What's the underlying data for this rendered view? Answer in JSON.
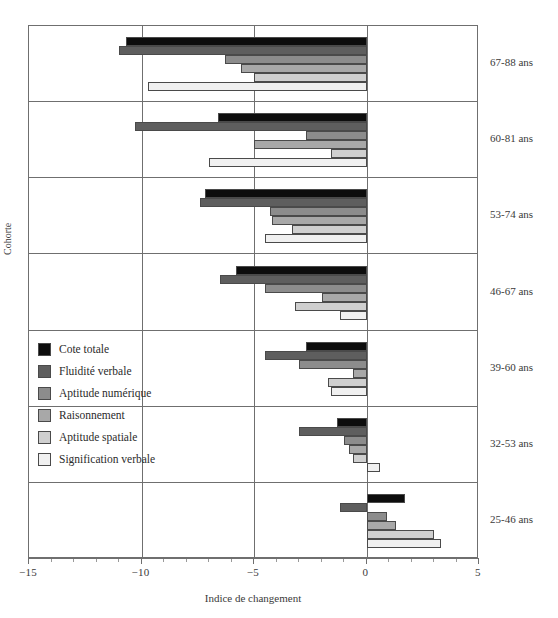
{
  "chart_data": {
    "type": "bar",
    "orientation": "horizontal",
    "title": "",
    "xlabel": "Indice de changement",
    "ylabel": "Cohorte",
    "xlim": [
      -15,
      5
    ],
    "xticks": [
      -15,
      -10,
      -5,
      0,
      5
    ],
    "xtick_labels": [
      "−15",
      "−10",
      "−5",
      "0",
      "5"
    ],
    "grid": "vertical gridlines at major x ticks; horizontal separators between cohort bands",
    "legend_position": "inside-left-middle",
    "categories": [
      "67-88 ans",
      "60-81 ans",
      "53-74 ans",
      "46-67 ans",
      "39-60 ans",
      "32-53 ans",
      "25-46 ans"
    ],
    "series": [
      {
        "name": "Cote totale",
        "color": "#0d0d0d",
        "values": [
          -10.7,
          -6.6,
          -7.2,
          -5.8,
          -2.7,
          -1.3,
          1.7
        ]
      },
      {
        "name": "Fluidité verbale",
        "color": "#5e5e5e",
        "values": [
          -11.0,
          -10.3,
          -7.4,
          -6.5,
          -4.5,
          -3.0,
          -1.2
        ]
      },
      {
        "name": "Aptitude numérique",
        "color": "#8c8c8c",
        "values": [
          -6.3,
          -2.7,
          -4.3,
          -4.5,
          -3.0,
          -1.0,
          0.9
        ]
      },
      {
        "name": "Raisonnement",
        "color": "#a8a8a8",
        "values": [
          -5.6,
          -5.0,
          -4.2,
          -2.0,
          -0.6,
          -0.8,
          1.3
        ]
      },
      {
        "name": "Aptitude spatiale",
        "color": "#cfcfcf",
        "values": [
          -5.0,
          -1.6,
          -3.3,
          -3.2,
          -1.7,
          -0.6,
          3.0
        ]
      },
      {
        "name": "Signification verbale",
        "color": "#f0f0f0",
        "values": [
          -9.7,
          -7.0,
          -4.5,
          -1.2,
          -1.6,
          0.6,
          3.3
        ]
      }
    ]
  },
  "axes": {
    "xlabel": "Indice de changement",
    "ylabel": "Cohorte",
    "tick_labels": [
      "−15",
      "−10",
      "−5",
      "0",
      "5"
    ]
  },
  "legend": {
    "items": [
      {
        "label": "Cote totale"
      },
      {
        "label": "Fluidité verbale"
      },
      {
        "label": "Aptitude numérique"
      },
      {
        "label": "Raisonnement"
      },
      {
        "label": "Aptitude spatiale"
      },
      {
        "label": "Signification verbale"
      }
    ]
  },
  "cohort_labels": [
    "67-88 ans",
    "60-81 ans",
    "53-74 ans",
    "46-67 ans",
    "39-60 ans",
    "32-53 ans",
    "25-46 ans"
  ]
}
